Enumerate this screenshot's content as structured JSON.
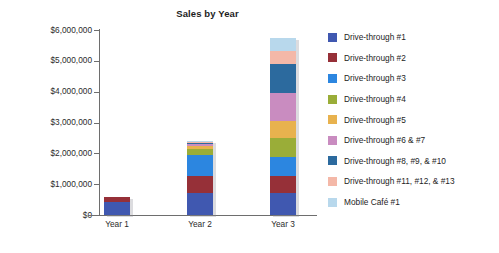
{
  "chart_data": {
    "type": "bar",
    "stacked": true,
    "title": "Sales by Year",
    "xlabel": "",
    "ylabel": "",
    "categories": [
      "Year 1",
      "Year 2",
      "Year 3"
    ],
    "ylim": [
      0,
      6000000
    ],
    "ytick_labels": [
      "$6,000,000",
      "$5,000,000",
      "$4,000,000",
      "$3,000,000",
      "$2,000,000",
      "$1,000,000",
      "$0"
    ],
    "ytick_values": [
      6000000,
      5000000,
      4000000,
      3000000,
      2000000,
      1000000,
      0
    ],
    "grid": false,
    "legend_position": "right",
    "series": [
      {
        "name": "Drive-through #1",
        "color": "#4058b0",
        "values": [
          430000,
          700000,
          700000
        ]
      },
      {
        "name": "Drive-through #2",
        "color": "#963038",
        "values": [
          170000,
          560000,
          560000
        ]
      },
      {
        "name": "Drive-through #3",
        "color": "#2c86e0",
        "values": [
          0,
          700000,
          620000
        ]
      },
      {
        "name": "Drive-through #4",
        "color": "#9aad38",
        "values": [
          0,
          180000,
          620000
        ]
      },
      {
        "name": "Drive-through #5",
        "color": "#e8b24e",
        "values": [
          0,
          100000,
          560000
        ]
      },
      {
        "name": "Drive-through #6 & #7",
        "color": "#c98cc0",
        "values": [
          0,
          60000,
          900000
        ]
      },
      {
        "name": "Drive-through #8, #9, & #10",
        "color": "#2c6a9e",
        "values": [
          0,
          40000,
          930000
        ]
      },
      {
        "name": "Drive-through #11, #12, & #13",
        "color": "#f4b8a8",
        "values": [
          0,
          30000,
          430000
        ]
      },
      {
        "name": "Mobile Café #1",
        "color": "#b8d8ec",
        "values": [
          0,
          20000,
          430000
        ]
      }
    ],
    "totals": [
      600000,
      2390000,
      5750000
    ]
  },
  "legend": {
    "items": [
      {
        "label": "Drive-through #1",
        "color": "#4058b0"
      },
      {
        "label": "Drive-through #2",
        "color": "#963038"
      },
      {
        "label": "Drive-through #3",
        "color": "#2c86e0"
      },
      {
        "label": "Drive-through #4",
        "color": "#9aad38"
      },
      {
        "label": "Drive-through #5",
        "color": "#e8b24e"
      },
      {
        "label": "Drive-through #6 & #7",
        "color": "#c98cc0"
      },
      {
        "label": "Drive-through #8, #9, & #10",
        "color": "#2c6a9e"
      },
      {
        "label": "Drive-through #11, #12, & #13",
        "color": "#f4b8a8"
      },
      {
        "label": "Mobile Café #1",
        "color": "#b8d8ec"
      }
    ]
  }
}
